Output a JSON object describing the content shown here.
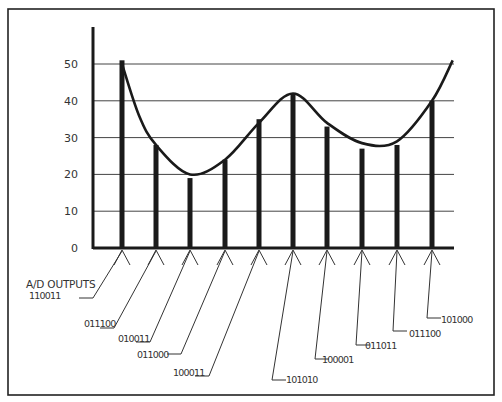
{
  "chart_data": {
    "type": "bar",
    "title": "",
    "xlabel": "A/D OUTPUTS",
    "ylabel": "",
    "ylim": [
      0,
      50
    ],
    "yticks": [
      "0",
      "10",
      "20",
      "30",
      "40",
      "50"
    ],
    "grid": true,
    "categories": [
      "110011",
      "011100",
      "010011",
      "011000",
      "100011",
      "101010",
      "100001",
      "011011",
      "011100",
      "101000"
    ],
    "values": [
      51,
      28,
      19,
      24,
      35,
      42,
      33,
      27,
      28,
      40
    ],
    "overlay": {
      "type": "line",
      "description": "smooth analog waveform sampled by bars",
      "points": [
        [
          0,
          50
        ],
        [
          0.5,
          36
        ],
        [
          1,
          28
        ],
        [
          2,
          20
        ],
        [
          3,
          24
        ],
        [
          4,
          34
        ],
        [
          5,
          42
        ],
        [
          6,
          34
        ],
        [
          7,
          28.5
        ],
        [
          8,
          29
        ],
        [
          9,
          40
        ],
        [
          9.6,
          51
        ]
      ]
    }
  },
  "labels": {
    "axis_label": "A/D OUTPUTS",
    "y_ticks": [
      "0",
      "10",
      "20",
      "30",
      "40",
      "50"
    ],
    "codes": [
      "110011",
      "011100",
      "010011",
      "011000",
      "100011",
      "101010",
      "100001",
      "011011",
      "011100",
      "101000"
    ]
  },
  "colors": {
    "ink": "#1a1a1a",
    "grid": "#444444",
    "background": "#ffffff"
  }
}
